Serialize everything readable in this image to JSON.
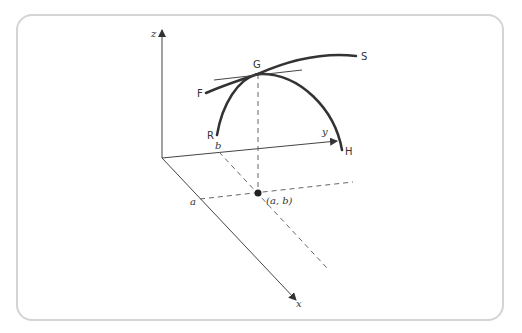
{
  "diagram": {
    "type": "3d-surface-curves",
    "axes": {
      "z": {
        "label": "z"
      },
      "y": {
        "label": "y"
      },
      "x": {
        "label": "x"
      }
    },
    "axis_marks": {
      "a": "a",
      "b": "b"
    },
    "point": {
      "label": "(a, b)"
    },
    "curves": {
      "curve_rgh": {
        "start_label": "R",
        "end_label": "H"
      },
      "curve_fgs": {
        "start_label": "F",
        "end_label": "S"
      }
    },
    "peak_point": {
      "label": "G"
    },
    "colors": {
      "curve": "#333333",
      "axis": "#444444",
      "dashed": "#666666",
      "border": "#d4d4d4"
    }
  }
}
